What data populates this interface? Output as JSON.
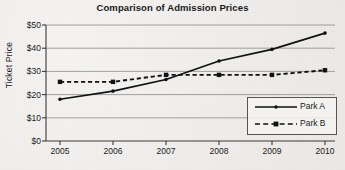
{
  "chart_data": {
    "type": "line",
    "title": "Comparison of Admission Prices",
    "xlabel": "",
    "ylabel": "Ticket Price",
    "categories": [
      "2005",
      "2006",
      "2007",
      "2008",
      "2009",
      "2010"
    ],
    "series": [
      {
        "name": "Park A",
        "style": "solid",
        "marker": "dot",
        "values": [
          18,
          21.5,
          26.5,
          34.5,
          39.5,
          46.5
        ]
      },
      {
        "name": "Park B",
        "style": "dashed",
        "marker": "square",
        "values": [
          25.5,
          25.5,
          28.5,
          28.5,
          28.5,
          30.5
        ]
      }
    ],
    "ylim": [
      0,
      50
    ],
    "yticks": [
      0,
      10,
      20,
      30,
      40,
      50
    ],
    "ytick_labels": [
      "$0",
      "$10",
      "$20",
      "$30",
      "$40",
      "$50"
    ],
    "xtick_labels": [
      "2005",
      "2006",
      "2007",
      "2008",
      "2009",
      "2010"
    ],
    "grid": "horizontal",
    "legend_position": "lower-right",
    "colors": {
      "series_a": "#111111",
      "series_b": "#111111",
      "grid": "#8c8c8c",
      "axis": "#3a3a3a",
      "background": "#efeeec"
    }
  }
}
